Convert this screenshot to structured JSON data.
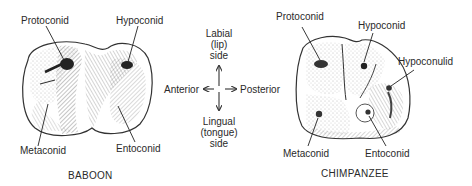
{
  "figure": {
    "baboon": {
      "caption": "BABOON",
      "labels": {
        "protoconid": "Protoconid",
        "hypoconid": "Hypoconid",
        "metaconid": "Metaconid",
        "entoconid": "Entoconid"
      }
    },
    "chimpanzee": {
      "caption": "CHIMPANZEE",
      "labels": {
        "protoconid": "Protoconid",
        "hypoconid": "Hypoconid",
        "hypoconulid": "Hypoconulid",
        "metaconid": "Metaconid",
        "entoconid": "Entoconid"
      }
    },
    "compass": {
      "top": [
        "Labial",
        "(lip)",
        "side"
      ],
      "bottom": [
        "Lingual",
        "(tongue)",
        "side"
      ],
      "left": "Anterior",
      "right": "Posterior"
    }
  }
}
